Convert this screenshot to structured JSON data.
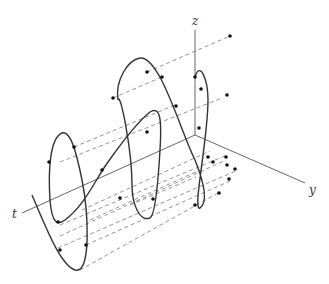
{
  "figure": {
    "axes": {
      "z_label": "z",
      "y_label": "y",
      "t_label": "t"
    },
    "colors": {
      "curve": "#333333",
      "axis": "#555555",
      "dash": "#777777",
      "point": "#111111"
    }
  }
}
